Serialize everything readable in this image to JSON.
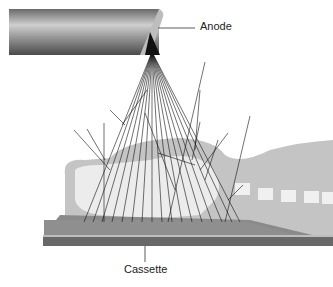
{
  "diagram": {
    "type": "x-ray scatter illustration",
    "labels": {
      "anode": "Anode",
      "cassette": "Cassette"
    },
    "colors": {
      "tube_dark": "#555555",
      "tube_light": "#d8d8d8",
      "patient_tissue": "#bdbdbd",
      "bone": "#eeeeee",
      "cassette_top": "#8a8a8a",
      "cassette_side": "#6a6a6a",
      "beam_lines": "#111111"
    }
  }
}
